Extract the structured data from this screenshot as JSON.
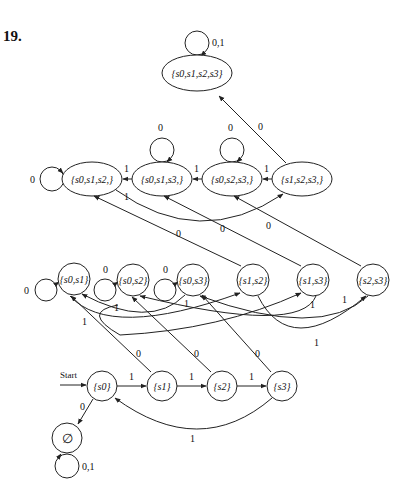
{
  "problem_number": "19.",
  "start_label": "Start",
  "states": {
    "all": "{s0,s1,s2,s3}",
    "s012": "{s0,s1,s2,}",
    "s013": "{s0,s1,s3,}",
    "s023": "{s0,s2,s3,}",
    "s123": "{s1,s2,s3,}",
    "s01": "{s0,s1}",
    "s02": "{s0,s2}",
    "s03": "{s0,s3}",
    "s12": "{s1,s2}",
    "s13": "{s1,s3}",
    "s23": "{s2,s3}",
    "s0": "{s0}",
    "s1": "{s1}",
    "s2": "{s2}",
    "s3": "{s3}",
    "empty": "∅"
  },
  "edge_labels": {
    "all_loop": "0,1",
    "s123_to_all": "0",
    "s012_loop": "0",
    "s013_loop": "0",
    "s023_loop": "0",
    "s013_to_s012": "1",
    "s023_to_s013": "1",
    "s123_to_s023": "1",
    "s012_to_s123": "1",
    "s12_to_s012": "0",
    "s13_to_s013": "0",
    "s23_to_s023": "0",
    "s01_loop": "0",
    "s02_loop": "0",
    "s03_loop": "0",
    "s01_to_s12": "1",
    "s02_to_s13": "1",
    "s03_to_s01": "1",
    "s13_to_s02": "1",
    "s23_to_s03": "1",
    "s12_to_s23": "1",
    "s1_to_s01": "0",
    "s2_to_s02": "0",
    "s3_to_s03": "0",
    "s0_to_s1": "1",
    "s1_to_s2": "1",
    "s2_to_s3": "1",
    "s3_to_s0": "1",
    "s0_to_empty": "0",
    "empty_loop": "0,1"
  }
}
